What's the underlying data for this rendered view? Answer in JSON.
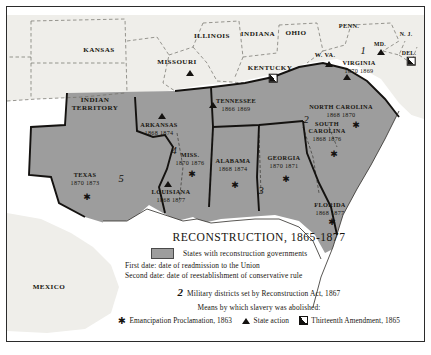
{
  "figure": {
    "kind": "historical-map",
    "region": "Southern and Central United States"
  },
  "colors": {
    "reconstruction_fill": "#9d9d9d",
    "other_state_fill": "#efeeea",
    "ocean": "#ffffff",
    "ink": "#17150f",
    "frame": "#2b2b2b"
  },
  "legend": {
    "title": "RECONSTRUCTION, 1865-1877",
    "swatch_label": "States with reconstruction governments",
    "first_date_line": "First date: date of readmission to the Union",
    "second_date_line": "Second date: date of reestablishment of conservative rule",
    "districts_number": "2",
    "districts_text": "Military districts set by Reconstruction Act, 1867",
    "means_heading": "Means by which slavery was abolished:",
    "symbols": [
      {
        "glyph": "✱",
        "icon": "star-symbol",
        "label": "Emancipation Proclamation, 1863"
      },
      {
        "glyph": "▲",
        "icon": "triangle-symbol",
        "label": "State action"
      },
      {
        "glyph": "◪",
        "icon": "half-square-symbol",
        "label": "Thirteenth Amendment, 1865"
      }
    ]
  },
  "states": [
    {
      "name": "KANSAS",
      "dates": "",
      "reconstruction": false,
      "x": 92,
      "y": 44,
      "size": "normal"
    },
    {
      "name": "INDIAN\nTERRITORY",
      "dates": "",
      "reconstruction": false,
      "x": 88,
      "y": 97,
      "size": "normal"
    },
    {
      "name": "MISSOURI",
      "dates": "",
      "reconstruction": false,
      "x": 170,
      "y": 56,
      "size": "normal"
    },
    {
      "name": "ILLINOIS",
      "dates": "",
      "reconstruction": false,
      "x": 205,
      "y": 30,
      "size": "normal"
    },
    {
      "name": "INDIANA",
      "dates": "",
      "reconstruction": false,
      "x": 251,
      "y": 28,
      "size": "normal"
    },
    {
      "name": "OHIO",
      "dates": "",
      "reconstruction": false,
      "x": 289,
      "y": 27,
      "size": "normal"
    },
    {
      "name": "PENN.",
      "dates": "",
      "reconstruction": false,
      "x": 342,
      "y": 19,
      "size": "small"
    },
    {
      "name": "N. J.",
      "dates": "",
      "reconstruction": false,
      "x": 399,
      "y": 27,
      "size": "tiny"
    },
    {
      "name": "MD.",
      "dates": "",
      "reconstruction": false,
      "x": 373,
      "y": 37,
      "size": "tiny"
    },
    {
      "name": "DEL.",
      "dates": "",
      "reconstruction": false,
      "x": 402,
      "y": 46,
      "size": "tiny"
    },
    {
      "name": "W. VA.",
      "dates": "",
      "reconstruction": false,
      "x": 318,
      "y": 48,
      "size": "small"
    },
    {
      "name": "KENTUCKY",
      "dates": "",
      "reconstruction": false,
      "x": 263,
      "y": 62,
      "size": "normal"
    },
    {
      "name": "MEXICO",
      "dates": "",
      "reconstruction": false,
      "x": 42,
      "y": 281,
      "size": "normal"
    },
    {
      "name": "VIRGINIA",
      "dates": "1870  1869",
      "reconstruction": true,
      "x": 352,
      "y": 60,
      "size": "small"
    },
    {
      "name": "TENNESSEE",
      "dates": "1866  1869",
      "reconstruction": true,
      "x": 229,
      "y": 98,
      "size": "small"
    },
    {
      "name": "NORTH CAROLINA",
      "dates": "1868  1870",
      "reconstruction": true,
      "x": 334,
      "y": 104,
      "size": "small"
    },
    {
      "name": "SOUTH\nCAROLINA",
      "dates": "1868  1876",
      "reconstruction": true,
      "x": 320,
      "y": 124,
      "size": "small"
    },
    {
      "name": "ARKANSAS",
      "dates": "1868  1874",
      "reconstruction": true,
      "x": 152,
      "y": 122,
      "size": "small"
    },
    {
      "name": "MISS.",
      "dates": "1870  1876",
      "reconstruction": true,
      "x": 183,
      "y": 152,
      "size": "small"
    },
    {
      "name": "ALABAMA",
      "dates": "1868  1874",
      "reconstruction": true,
      "x": 226,
      "y": 158,
      "size": "small"
    },
    {
      "name": "GEORGIA",
      "dates": "1870  1871",
      "reconstruction": true,
      "x": 277,
      "y": 155,
      "size": "small"
    },
    {
      "name": "LOUISIANA",
      "dates": "1868  1877",
      "reconstruction": true,
      "x": 164,
      "y": 189,
      "size": "small"
    },
    {
      "name": "TEXAS",
      "dates": "1870  1873",
      "reconstruction": true,
      "x": 78,
      "y": 172,
      "size": "small"
    },
    {
      "name": "FLORIDA",
      "dates": "1868  1877",
      "reconstruction": true,
      "x": 323,
      "y": 202,
      "size": "small"
    }
  ],
  "military_districts": [
    {
      "number": "1",
      "x": 356,
      "y": 43
    },
    {
      "number": "2",
      "x": 299,
      "y": 112
    },
    {
      "number": "3",
      "x": 254,
      "y": 183
    },
    {
      "number": "4",
      "x": 167,
      "y": 143
    },
    {
      "number": "5",
      "x": 114,
      "y": 171
    }
  ],
  "abolition_symbols": [
    {
      "icon": "triangle-symbol",
      "state": "MISSOURI",
      "x": 183,
      "y": 66
    },
    {
      "icon": "triangle-symbol",
      "state": "W. VA.",
      "x": 322,
      "y": 57
    },
    {
      "icon": "triangle-symbol",
      "state": "MD.",
      "x": 374,
      "y": 45
    },
    {
      "icon": "half-square-symbol",
      "state": "DEL.",
      "x": 404,
      "y": 54
    },
    {
      "icon": "half-square-symbol",
      "state": "KENTUCKY",
      "x": 266,
      "y": 71
    },
    {
      "icon": "triangle-symbol",
      "state": "VIRGINIA",
      "x": 340,
      "y": 70
    },
    {
      "icon": "triangle-symbol",
      "state": "TENNESSEE",
      "x": 206,
      "y": 98
    },
    {
      "icon": "triangle-symbol",
      "state": "ARKANSAS",
      "x": 155,
      "y": 109
    },
    {
      "icon": "triangle-symbol",
      "state": "LOUISIANA",
      "x": 161,
      "y": 177
    },
    {
      "icon": "star-symbol",
      "state": "TEXAS",
      "x": 80,
      "y": 190
    },
    {
      "icon": "star-symbol",
      "state": "MISS.",
      "x": 185,
      "y": 167
    },
    {
      "icon": "star-symbol",
      "state": "ALABAMA",
      "x": 228,
      "y": 178
    },
    {
      "icon": "star-symbol",
      "state": "GEORGIA",
      "x": 279,
      "y": 172
    },
    {
      "icon": "star-symbol",
      "state": "SOUTH CAROLINA",
      "x": 327,
      "y": 147
    },
    {
      "icon": "star-symbol",
      "state": "NORTH CAROLINA",
      "x": 349,
      "y": 118
    },
    {
      "icon": "star-symbol",
      "state": "FLORIDA",
      "x": 325,
      "y": 215
    }
  ]
}
